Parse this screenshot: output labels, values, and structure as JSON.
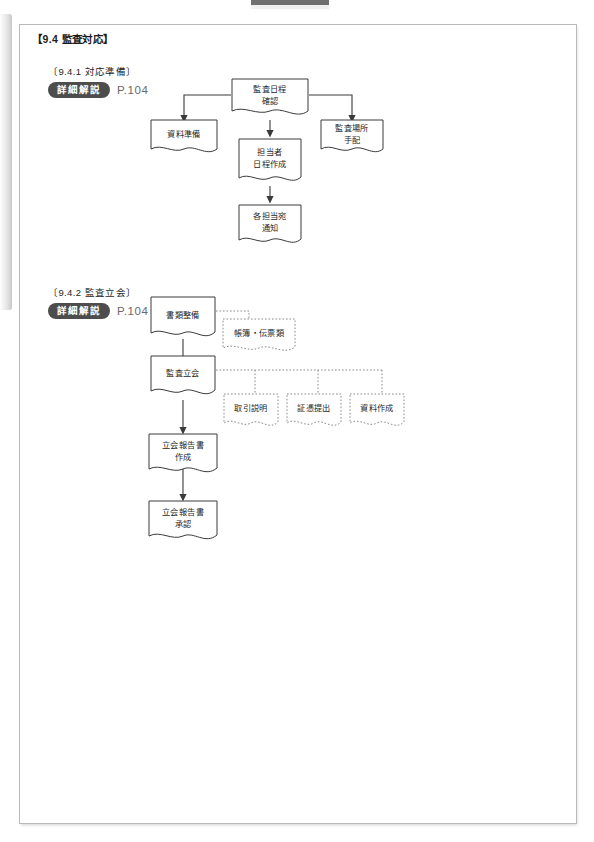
{
  "page": {
    "section_title": "【9.4  監査対応】",
    "artifacts": {
      "left_edge": "page-edge-shadow",
      "top_mark": "scan-registration-mark"
    }
  },
  "subsections": [
    {
      "id": "9-4-1",
      "heading": "〔9.4.1  対応準備〕",
      "reference": {
        "badge": "詳細解説",
        "page": "P.104"
      }
    },
    {
      "id": "9-4-2",
      "heading": "〔9.4.2  監査立会〕",
      "reference": {
        "badge": "詳細解説",
        "page": "P.104"
      }
    }
  ],
  "flow1": {
    "nodes": [
      {
        "key": "n1",
        "label": "監査日程\n確認",
        "line1": "監査日程",
        "line2": "確認",
        "style": "solid"
      },
      {
        "key": "n2",
        "label": "資料準備",
        "line1": "資料準備",
        "line2": "",
        "style": "solid"
      },
      {
        "key": "n3",
        "label": "監査場所\n手配",
        "line1": "監査場所",
        "line2": "手配",
        "style": "solid"
      },
      {
        "key": "n4",
        "label": "担当者\n日程作成",
        "line1": "担当者",
        "line2": "日程作成",
        "style": "solid"
      },
      {
        "key": "n5",
        "label": "各担当宛\n通知",
        "line1": "各担当宛",
        "line2": "通知",
        "style": "solid"
      }
    ],
    "edges": [
      {
        "from": "n1",
        "to": "n2",
        "kind": "solid-arrow"
      },
      {
        "from": "n1",
        "to": "n3",
        "kind": "solid-arrow"
      },
      {
        "from": "n1",
        "to": "n4",
        "kind": "solid-arrow"
      },
      {
        "from": "n4",
        "to": "n5",
        "kind": "solid-arrow"
      }
    ]
  },
  "flow2": {
    "nodes": [
      {
        "key": "m1",
        "label": "書類整備",
        "line1": "書類整備",
        "line2": "",
        "style": "solid"
      },
      {
        "key": "m2",
        "label": "帳簿・伝票類",
        "line1": "帳簿・伝票類",
        "line2": "",
        "style": "dotted"
      },
      {
        "key": "m3",
        "label": "監査立会",
        "line1": "監査立会",
        "line2": "",
        "style": "solid"
      },
      {
        "key": "m4",
        "label": "取引説明",
        "line1": "取引説明",
        "line2": "",
        "style": "dotted"
      },
      {
        "key": "m5",
        "label": "証憑提出",
        "line1": "証憑提出",
        "line2": "",
        "style": "dotted"
      },
      {
        "key": "m6",
        "label": "資料作成",
        "line1": "資料作成",
        "line2": "",
        "style": "dotted"
      },
      {
        "key": "m7",
        "label": "立会報告書\n作成",
        "line1": "立会報告書",
        "line2": "作成",
        "style": "solid"
      },
      {
        "key": "m8",
        "label": "立会報告書\n承認",
        "line1": "立会報告書",
        "line2": "承認",
        "style": "solid"
      }
    ],
    "edges": [
      {
        "from": "m1",
        "to": "m2",
        "kind": "dotted"
      },
      {
        "from": "m1",
        "to": "m3",
        "kind": "solid-arrow"
      },
      {
        "from": "m3",
        "to": "m4",
        "kind": "dotted"
      },
      {
        "from": "m3",
        "to": "m5",
        "kind": "dotted"
      },
      {
        "from": "m3",
        "to": "m6",
        "kind": "dotted"
      },
      {
        "from": "m3",
        "to": "m7",
        "kind": "solid-arrow"
      },
      {
        "from": "m7",
        "to": "m8",
        "kind": "solid-arrow"
      }
    ]
  },
  "colors": {
    "frame_border": "#b9b9b9",
    "node_stroke": "#3a3a3a",
    "badge_bg": "#4d4d4d",
    "badge_text": "#ffffff",
    "page_ref_text": "#6a6a6a",
    "paper": "#ffffff"
  }
}
